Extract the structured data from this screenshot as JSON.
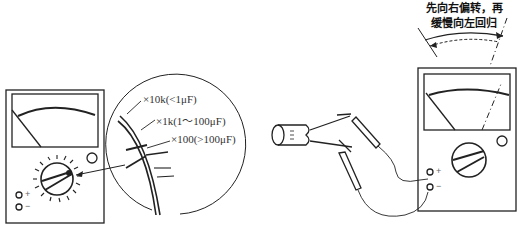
{
  "diagram": {
    "caption": {
      "line1": "先向右偏转，再",
      "line2": "缓慢向左回归"
    },
    "range_callout": {
      "items": [
        {
          "label": "×10k(<1μF)"
        },
        {
          "label": "×1k(1～100μF)"
        },
        {
          "label": "×100(>100μF)"
        }
      ]
    },
    "left_meter": {
      "terminals": [
        {
          "label": "+"
        },
        {
          "label": "−"
        }
      ]
    },
    "right_meter": {
      "terminals": [
        {
          "label": "+"
        },
        {
          "label": "−"
        }
      ]
    },
    "colors": {
      "stroke": "#222222",
      "background": "#ffffff"
    }
  }
}
